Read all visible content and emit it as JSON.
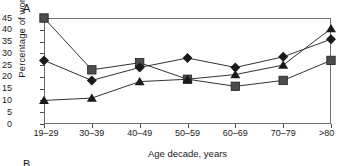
{
  "figure": {
    "panel_a_label": "A",
    "panel_b_label": "B"
  },
  "chart_data": {
    "type": "line",
    "title": "",
    "xlabel": "Age decade, years",
    "ylabel": "Percentage of women",
    "categories": [
      "19–29",
      "30–39",
      "40–49",
      "50–59",
      "60–69",
      "70–79",
      ">80"
    ],
    "yticks": [
      0,
      5,
      10,
      15,
      20,
      25,
      30,
      35,
      40,
      45
    ],
    "ylim": [
      0,
      45
    ],
    "grid": false,
    "legend": "none",
    "series": [
      {
        "name": "square-series",
        "marker": "square",
        "color": "#4d4d4d",
        "values": [
          45,
          23,
          26,
          19,
          16,
          18.5,
          27
        ]
      },
      {
        "name": "diamond-series",
        "marker": "diamond",
        "color": "#1a1a1a",
        "values": [
          27,
          18.5,
          24,
          28,
          24,
          28.5,
          36
        ]
      },
      {
        "name": "triangle-series",
        "marker": "triangle",
        "color": "#1a1a1a",
        "values": [
          10,
          11,
          18,
          19,
          21,
          25,
          40.5
        ]
      }
    ]
  }
}
